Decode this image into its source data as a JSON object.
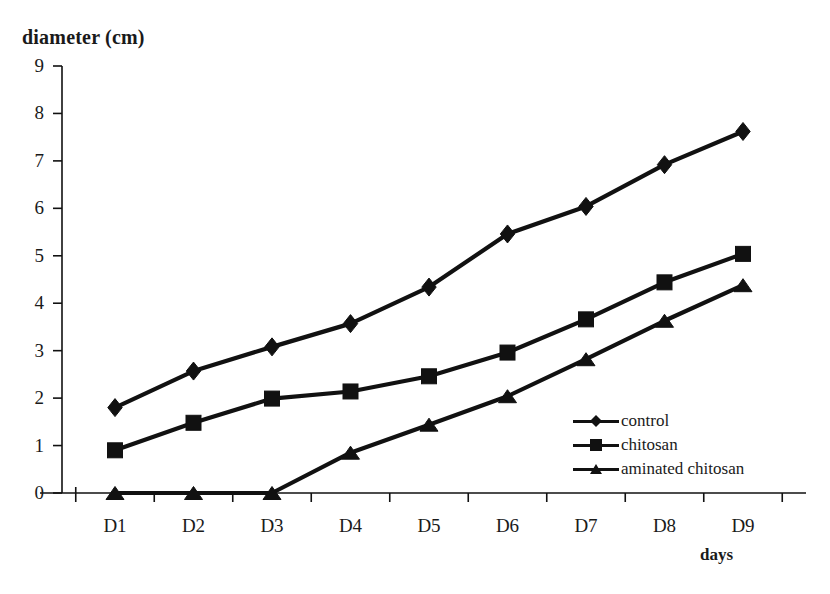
{
  "chart_data": {
    "type": "line",
    "title": "",
    "ylabel": "diameter (cm)",
    "xlabel": "days",
    "categories": [
      "D1",
      "D2",
      "D3",
      "D4",
      "D5",
      "D6",
      "D7",
      "D8",
      "D9"
    ],
    "ylim": [
      0,
      9
    ],
    "yticks": [
      0,
      1,
      2,
      3,
      4,
      5,
      6,
      7,
      8,
      9
    ],
    "grid": false,
    "legend_position": "inside-lower-right",
    "series": [
      {
        "name": "control",
        "marker": "diamond",
        "color": "#111111",
        "values": [
          1.8,
          2.57,
          3.08,
          3.57,
          4.34,
          5.46,
          6.04,
          6.92,
          7.62
        ]
      },
      {
        "name": "chitosan",
        "marker": "square",
        "color": "#111111",
        "values": [
          0.9,
          1.48,
          1.99,
          2.14,
          2.46,
          2.96,
          3.66,
          4.44,
          5.04
        ]
      },
      {
        "name": "aminated chitosan",
        "marker": "triangle",
        "color": "#111111",
        "values": [
          0.0,
          0.0,
          0.0,
          0.85,
          1.44,
          2.04,
          2.82,
          3.63,
          4.38
        ]
      }
    ]
  },
  "axis": {
    "ytick_labels": [
      "9",
      "8",
      "7",
      "6",
      "5",
      "4",
      "3",
      "2",
      "1",
      "0"
    ],
    "xtick_labels": [
      "D1",
      "D2",
      "D3",
      "D4",
      "D5",
      "D6",
      "D7",
      "D8",
      "D9"
    ]
  },
  "legend": {
    "items": [
      {
        "label": "control",
        "marker": "diamond"
      },
      {
        "label": "chitosan",
        "marker": "square"
      },
      {
        "label": "aminated chitosan",
        "marker": "triangle"
      }
    ]
  },
  "style": {
    "axis_color": "#111111",
    "line_color": "#111111",
    "background": "#ffffff"
  }
}
